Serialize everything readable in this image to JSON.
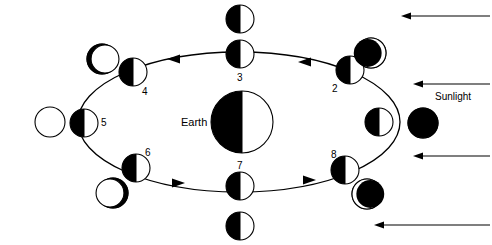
{
  "diagram": {
    "title_labels": {
      "earth": "Earth",
      "sunlight": "Sunlight"
    },
    "colors": {
      "stroke": "#000000",
      "dark": "#000000",
      "light": "#ffffff",
      "background": "#ffffff"
    },
    "orbit": {
      "cx": 239,
      "cy": 122,
      "rx": 161,
      "ry": 70,
      "direction": "counterclockwise"
    },
    "earth_body": {
      "cx": 242,
      "cy": 122,
      "r": 31,
      "shading": "left-half-dark",
      "label": "Earth",
      "label_x": 181,
      "label_y": 117
    },
    "orbit_positions": [
      {
        "number": "1",
        "cx": 379,
        "cy": 122,
        "r": 14,
        "shading": "left-half-dark",
        "label_x": 366,
        "label_y": 116,
        "phase_name": "new-moon",
        "phase": {
          "cx": 423,
          "cy": 123,
          "r": 15,
          "appearance": "full-dark"
        }
      },
      {
        "number": "2",
        "cx": 350,
        "cy": 70,
        "r": 14,
        "shading": "left-half-dark",
        "label_x": 332,
        "label_y": 84,
        "phase_name": "waning-crescent",
        "phase": {
          "cx": 371,
          "cy": 53,
          "r": 15,
          "appearance": "dark-with-right-crescent-light"
        }
      },
      {
        "number": "3",
        "cx": 240,
        "cy": 54,
        "r": 14,
        "shading": "left-half-dark",
        "label_x": 237,
        "label_y": 73,
        "phase_name": "last-quarter",
        "phase": {
          "cx": 240,
          "cy": 19,
          "r": 14,
          "appearance": "left-half-dark"
        }
      },
      {
        "number": "4",
        "cx": 133,
        "cy": 72,
        "r": 14,
        "shading": "left-half-dark",
        "label_x": 142,
        "label_y": 87,
        "phase_name": "waxing-gibbous",
        "phase": {
          "cx": 102,
          "cy": 59,
          "r": 15,
          "appearance": "light-with-left-crescent-dark"
        }
      },
      {
        "number": "5",
        "cx": 84,
        "cy": 123,
        "r": 14,
        "shading": "left-half-dark",
        "label_x": 101,
        "label_y": 118,
        "phase_name": "full-moon",
        "phase": {
          "cx": 50,
          "cy": 122,
          "r": 15,
          "appearance": "full-light"
        }
      },
      {
        "number": "6",
        "cx": 136,
        "cy": 168,
        "r": 14,
        "shading": "left-half-dark",
        "label_x": 145,
        "label_y": 148,
        "phase_name": "waning-gibbous",
        "phase": {
          "cx": 113,
          "cy": 193,
          "r": 15,
          "appearance": "light-with-right-crescent-dark"
        }
      },
      {
        "number": "7",
        "cx": 240,
        "cy": 186,
        "r": 14,
        "shading": "left-half-dark",
        "label_x": 237,
        "label_y": 161,
        "phase_name": "first-quarter",
        "phase": {
          "cx": 240,
          "cy": 226,
          "r": 14,
          "appearance": "left-half-dark"
        }
      },
      {
        "number": "8",
        "cx": 345,
        "cy": 170,
        "r": 14,
        "shading": "left-half-dark",
        "label_x": 331,
        "label_y": 150,
        "phase_name": "waxing-crescent",
        "phase": {
          "cx": 367,
          "cy": 194,
          "r": 15,
          "appearance": "dark-with-left-crescent-light"
        }
      }
    ],
    "orbit_arrows": [
      {
        "x": 176,
        "y": 59,
        "direction": "left"
      },
      {
        "x": 307,
        "y": 62,
        "direction": "left"
      },
      {
        "x": 176,
        "y": 183,
        "direction": "right"
      },
      {
        "x": 307,
        "y": 180,
        "direction": "right"
      }
    ],
    "sunlight_rays": [
      {
        "x1": 490,
        "y1": 16,
        "x2": 401,
        "y2": 16
      },
      {
        "x1": 490,
        "y1": 84,
        "x2": 413,
        "y2": 84
      },
      {
        "x1": 490,
        "y1": 156,
        "x2": 413,
        "y2": 156
      },
      {
        "x1": 490,
        "y1": 225,
        "x2": 374,
        "y2": 225
      }
    ],
    "sunlight_text": {
      "text": "Sunlight",
      "x": 435,
      "y": 92
    }
  }
}
